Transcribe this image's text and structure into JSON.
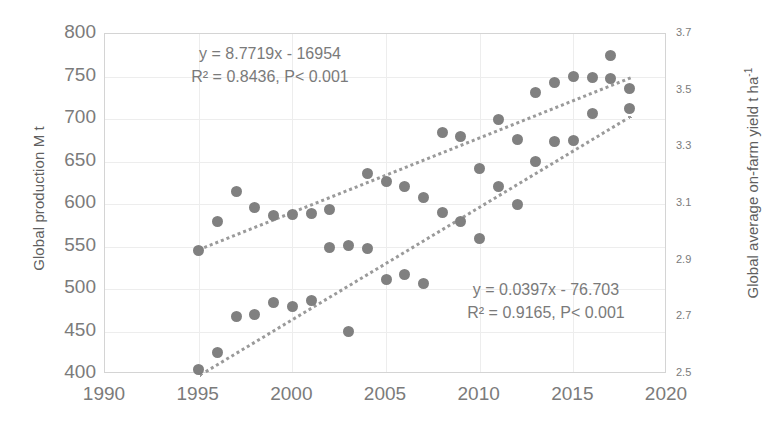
{
  "chart_data": {
    "type": "scatter",
    "title": "",
    "xlabel": "",
    "ylabel": "Global production M t",
    "y2label": "Global average on-farm yield t ha",
    "y2label_sup": "-1",
    "xlim": [
      1990,
      2020
    ],
    "ylim": [
      400,
      800
    ],
    "y2lim": [
      2.5,
      3.7
    ],
    "xticks": [
      "1990",
      "1995",
      "2000",
      "2005",
      "2010",
      "2015",
      "2020"
    ],
    "yticks": [
      "400",
      "450",
      "500",
      "550",
      "600",
      "650",
      "700",
      "750",
      "800"
    ],
    "y2ticks": [
      "2.5",
      "2.7",
      "2.9",
      "3.1",
      "3.3",
      "3.5",
      "3.7"
    ],
    "grid": true,
    "legend": "none",
    "marker_color": "#808080",
    "trendline_color": "#9a9a9a",
    "gridline_color": "#ededed",
    "axis_color": "#d4d4d4",
    "series": [
      {
        "name": "Global production M t",
        "axis": "left",
        "x": [
          1995,
          1996,
          1997,
          1998,
          1999,
          2000,
          2001,
          2002,
          2003,
          2004,
          2005,
          2006,
          2007,
          2008,
          2009,
          2010,
          2011,
          2012,
          2013,
          2014,
          2015,
          2016,
          2017,
          2018
        ],
        "y": [
          545,
          580,
          615,
          596,
          586,
          588,
          589,
          593,
          551,
          636,
          626,
          621,
          608,
          684,
          680,
          642,
          699,
          676,
          731,
          743,
          750,
          749,
          775,
          736
        ]
      },
      {
        "name": "Global average on-farm yield t ha-1",
        "axis": "right",
        "x": [
          1995,
          1996,
          1997,
          1998,
          1999,
          2000,
          2001,
          2002,
          2003,
          2004,
          2005,
          2006,
          2007,
          2008,
          2009,
          2010,
          2011,
          2012,
          2013,
          2014,
          2015,
          2016,
          2017,
          2018
        ],
        "y_left_scale": [
          405,
          425,
          468,
          470,
          484,
          479,
          487,
          549,
          450,
          548,
          511,
          517,
          506,
          590,
          580,
          559,
          621,
          600,
          650,
          673,
          675,
          707,
          748,
          712
        ],
        "y_right_scale": [
          2.515,
          2.575,
          2.704,
          2.71,
          2.752,
          2.737,
          2.761,
          2.947,
          2.65,
          2.944,
          2.833,
          2.851,
          2.818,
          3.07,
          3.04,
          2.977,
          3.163,
          3.1,
          3.25,
          3.319,
          3.325,
          3.421,
          3.544,
          3.436
        ]
      }
    ],
    "trendlines": [
      {
        "for": "Global production M t",
        "equation": "y = 8.7719x - 16954",
        "stats": "R² = 0.8436, P< 0.001",
        "slope": 8.7719,
        "intercept": -16954,
        "x_start": 1995,
        "x_end": 2018,
        "y_start": 547.95,
        "y_end": 749.7
      },
      {
        "for": "Global average on-farm yield t ha-1",
        "equation": "y = 0.0397x - 76.703",
        "stats": "R² = 0.9165, P< 0.001",
        "slope": 0.0397,
        "intercept": -76.703,
        "x_start": 1995,
        "x_end": 2018,
        "y_start": 2.499,
        "y_end": 3.412
      }
    ],
    "annotations": [
      {
        "id": "eq-top",
        "line1": "y = 8.7719x - 16954",
        "line2": "R² = 0.8436, P< 0.001"
      },
      {
        "id": "eq-bottom",
        "line1": "y = 0.0397x - 76.703",
        "line2": "R² = 0.9165, P< 0.001"
      }
    ]
  }
}
